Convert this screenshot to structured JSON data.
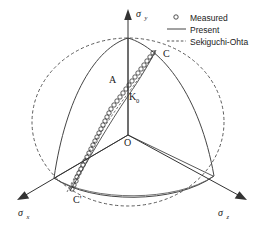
{
  "figure": {
    "type": "principal-stress-space-yield-surface",
    "background": "#ffffff",
    "line_color": "#3a3a3a",
    "marker_color": "#3a3a3a"
  },
  "axes": {
    "y": {
      "label": "σ",
      "sub": "y",
      "direction": "up"
    },
    "x": {
      "label": "σ",
      "sub": "x",
      "direction": "down-left"
    },
    "z": {
      "label": "σ",
      "sub": "z",
      "direction": "down-right"
    }
  },
  "annotations": [
    {
      "name": "point-A",
      "text": "A"
    },
    {
      "name": "point-K0",
      "text": "K",
      "sub": "0"
    },
    {
      "name": "origin-O",
      "text": "O"
    },
    {
      "name": "point-C",
      "text": "C"
    },
    {
      "name": "point-C-prime",
      "text": "C'"
    }
  ],
  "legend": {
    "items": [
      {
        "key": "measured",
        "label": "Measured",
        "style": "circle-marker"
      },
      {
        "key": "present",
        "label": "Present",
        "style": "solid-line"
      },
      {
        "key": "sekiguchi-ohta",
        "label": "Sekiguchi-Ohta",
        "style": "dashed-line"
      }
    ]
  },
  "chart_data": {
    "type": "scatter",
    "title": "",
    "xlabel": "σx",
    "ylabel": "σy",
    "zlabel": "σz",
    "grid": false,
    "legend_position": "top-right",
    "series": [
      {
        "name": "Measured",
        "style": "open-circle-markers",
        "comment": "chain of measured stress states from C' (lower-left) through K0/A to C (upper-right)",
        "points": [
          [
            72,
            189
          ],
          [
            74,
            185
          ],
          [
            76,
            181
          ],
          [
            77,
            177
          ],
          [
            79,
            173
          ],
          [
            81,
            169
          ],
          [
            83,
            165
          ],
          [
            85,
            161
          ],
          [
            87,
            157
          ],
          [
            89,
            153
          ],
          [
            91,
            149
          ],
          [
            93,
            145
          ],
          [
            95,
            141
          ],
          [
            97,
            137
          ],
          [
            99,
            133
          ],
          [
            101,
            129
          ],
          [
            103,
            125
          ],
          [
            105,
            121
          ],
          [
            107,
            117
          ],
          [
            109,
            113
          ],
          [
            111,
            109
          ],
          [
            114,
            105
          ],
          [
            117,
            101
          ],
          [
            120,
            97
          ],
          [
            123,
            93
          ],
          [
            126,
            89
          ],
          [
            129,
            85
          ],
          [
            132,
            81
          ],
          [
            135,
            77
          ],
          [
            138,
            73
          ],
          [
            141,
            69
          ],
          [
            144,
            65
          ],
          [
            147,
            61
          ],
          [
            150,
            57
          ],
          [
            153,
            53
          ]
        ],
        "count": 35
      },
      {
        "name": "Present",
        "style": "solid",
        "comment": "rounded-triangular yield locus (deviatoric trace) inscribed in the circle"
      },
      {
        "name": "Sekiguchi-Ohta",
        "style": "dashed",
        "comment": "circular yield locus (von Mises type trace)"
      }
    ],
    "axis_ranges": {
      "x": [
        0,
        269
      ],
      "y": [
        0,
        231
      ]
    }
  }
}
